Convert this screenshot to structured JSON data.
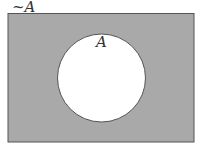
{
  "diagram": {
    "type": "venn",
    "universe_label": "~A",
    "set_label": "A",
    "colors": {
      "shaded": "#a9a9a9",
      "set_fill": "#ffffff",
      "outline": "#555555"
    }
  }
}
